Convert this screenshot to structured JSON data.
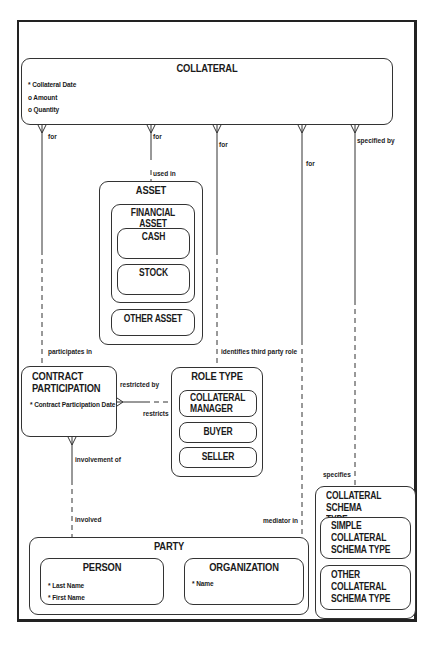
{
  "diagram": {
    "type": "entity-relationship",
    "entities": {
      "collateral": {
        "title": "COLLATERAL",
        "attributes": [
          "* Collateral Date",
          "o Amount",
          "o Quantity"
        ]
      },
      "asset": {
        "title": "ASSET",
        "financial_asset": {
          "title": "FINANCIAL ASSET",
          "cash": "CASH",
          "stock": "STOCK"
        },
        "other_asset": "OTHER ASSET"
      },
      "contract_participation": {
        "title_line1": "CONTRACT",
        "title_line2": "PARTICIPATION",
        "attributes": [
          "* Contract Participation Date"
        ]
      },
      "role_type": {
        "title": "ROLE TYPE",
        "collateral_manager_line1": "COLLATERAL",
        "collateral_manager_line2": "MANAGER",
        "buyer": "BUYER",
        "seller": "SELLER"
      },
      "party": {
        "title": "PARTY",
        "person": {
          "title": "PERSON",
          "attributes": [
            "* Last Name",
            "* First Name"
          ]
        },
        "organization": {
          "title": "ORGANIZATION",
          "attributes": [
            "* Name"
          ]
        }
      },
      "collateral_schema_type": {
        "title_line1": "COLLATERAL SCHEMA",
        "title_line2": "TYPE",
        "simple_line1": "SIMPLE COLLATERAL",
        "simple_line2": "SCHEMA TYPE",
        "other_line1": "OTHER COLLATERAL",
        "other_line2": "SCHEMA TYPE"
      }
    },
    "relationships": {
      "collateral_contract": {
        "from_label": "for",
        "to_label": "participates in"
      },
      "collateral_asset": {
        "from_label": "for",
        "to_label": "used in"
      },
      "collateral_roletype": {
        "from_label": "for",
        "to_label": "identifies third party role"
      },
      "collateral_party": {
        "from_label": "for",
        "to_label": "mediator in"
      },
      "collateral_schema": {
        "from_label": "specified by",
        "to_label": "specifies"
      },
      "contract_roletype": {
        "from_label": "restricted by",
        "to_label": "restricts"
      },
      "contract_party": {
        "from_label": "involvement of",
        "to_label": "involved"
      }
    }
  }
}
